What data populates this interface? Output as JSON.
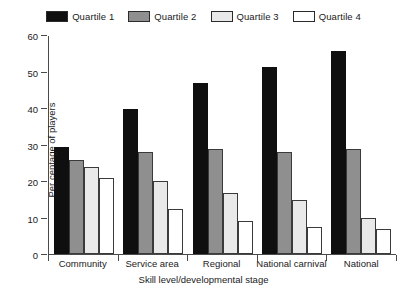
{
  "chart_data": {
    "type": "bar",
    "title": "",
    "xlabel": "Skill level/developmental stage",
    "ylabel": "Per centage of players",
    "ylim": [
      0,
      60
    ],
    "yticks": [
      0,
      10,
      20,
      30,
      40,
      50,
      60
    ],
    "grid": false,
    "legend_position": "top-center",
    "categories": [
      "Community",
      "Service area",
      "Regional",
      "National carnival",
      "National"
    ],
    "series": [
      {
        "name": "Quartile 1",
        "color": "#100f10",
        "values": [
          29.5,
          40,
          47,
          51.5,
          56
        ]
      },
      {
        "name": "Quartile 2",
        "color": "#8f8f8f",
        "values": [
          26,
          28,
          29,
          28,
          29
        ]
      },
      {
        "name": "Quartile 3",
        "color": "#e9e9e9",
        "values": [
          24,
          20,
          16.8,
          15,
          10
        ]
      },
      {
        "name": "Quartile 4",
        "color": "#ffffff",
        "values": [
          21,
          12.5,
          9,
          7.5,
          7
        ]
      }
    ]
  }
}
